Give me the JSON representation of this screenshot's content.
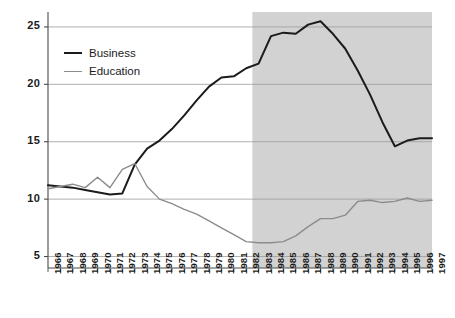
{
  "chart_data": {
    "type": "line",
    "title": "",
    "xlabel": "",
    "ylabel": "",
    "xlim": [
      1966,
      1997
    ],
    "ylim": [
      4.0,
      26.3
    ],
    "yticks": [
      5,
      10,
      15,
      20,
      25
    ],
    "grid": "horizontal",
    "legend_position": "upper-left-inside",
    "categories": [
      "1966",
      "1967",
      "1968",
      "1969",
      "1970",
      "1971",
      "1972",
      "1973",
      "1974",
      "1975",
      "1976",
      "1977",
      "1978",
      "1979",
      "1980",
      "1981",
      "1982",
      "1983",
      "1984",
      "1985",
      "1986",
      "1987",
      "1988",
      "1989",
      "1990",
      "1991",
      "1992",
      "1993",
      "1994",
      "1995",
      "1996",
      "1997"
    ],
    "series": [
      {
        "name": "Business",
        "color": "#1b1b1b",
        "values": [
          11.2,
          11.1,
          11.0,
          10.8,
          10.6,
          10.4,
          10.5,
          13.0,
          14.4,
          15.1,
          16.1,
          17.3,
          18.6,
          19.8,
          20.6,
          20.7,
          21.4,
          21.8,
          24.2,
          24.5,
          24.4,
          25.2,
          25.5,
          24.4,
          23.1,
          21.2,
          19.1,
          16.7,
          14.6,
          15.1,
          15.3,
          15.3
        ]
      },
      {
        "name": "Education",
        "color": "#8c8c8c",
        "values": [
          10.9,
          11.1,
          11.3,
          11.0,
          11.9,
          11.0,
          12.6,
          13.1,
          11.1,
          10.0,
          9.6,
          9.1,
          8.7,
          8.1,
          7.5,
          6.9,
          6.3,
          6.2,
          6.2,
          6.3,
          6.8,
          7.6,
          8.3,
          8.3,
          8.6,
          9.8,
          9.9,
          9.7,
          9.8,
          10.1,
          9.8,
          9.9
        ]
      }
    ],
    "shaded_region": {
      "name": "highlight-band",
      "from": "1982",
      "to": "1997",
      "color": "#d2d2d2"
    },
    "axis_color": "#4a4a4a",
    "grid_color": "#9a9a9a",
    "background": "#ffffff"
  },
  "legend": {
    "items": [
      {
        "label": "Business",
        "color": "#1b1b1b"
      },
      {
        "label": "Education",
        "color": "#8c8c8c"
      }
    ]
  }
}
